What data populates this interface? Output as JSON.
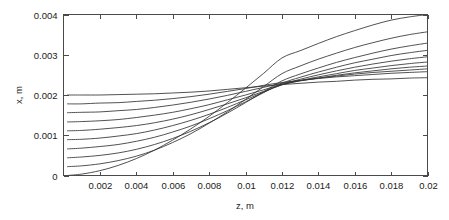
{
  "chart_data": {
    "type": "line",
    "title": "",
    "xlabel": "z, m",
    "ylabel": "x, m",
    "xlim": [
      0,
      0.02
    ],
    "ylim": [
      0,
      0.004
    ],
    "grid": false,
    "legend": null,
    "legend_position": "none",
    "xticks": [
      0.002,
      0.004,
      0.006,
      0.008,
      0.01,
      0.012,
      0.014,
      0.016,
      0.018,
      0.02
    ],
    "xtick_labels": [
      "0.002",
      "0.004",
      "0.006",
      "0.008",
      "0.01",
      "0.012",
      "0.014",
      "0.016",
      "0.018",
      "0.02"
    ],
    "yticks": [
      0,
      0.001,
      0.002,
      0.003,
      0.004
    ],
    "ytick_labels": [
      "0",
      "0.001",
      "0.002",
      "0.003",
      "0.004"
    ],
    "x": [
      0.0002,
      0.001,
      0.002,
      0.003,
      0.004,
      0.005,
      0.006,
      0.007,
      0.008,
      0.009,
      0.01,
      0.011,
      0.012,
      0.013,
      0.014,
      0.015,
      0.016,
      0.017,
      0.018,
      0.019,
      0.02
    ],
    "series": [
      {
        "name": "curve-1",
        "x0": 0.0002,
        "y0": 0.0,
        "values": [
          0.0,
          3.5e-05,
          0.00012,
          0.00025,
          0.00042,
          0.00063,
          0.00088,
          0.00116,
          0.00147,
          0.00181,
          0.00217,
          0.00254,
          0.00292,
          0.0031,
          0.00328,
          0.00345,
          0.0036,
          0.00374,
          0.00386,
          0.00394,
          0.004
        ]
      },
      {
        "name": "curve-2",
        "x0": 0.0002,
        "y0": 0.00022,
        "values": [
          0.00022,
          0.00024,
          0.00029,
          0.00037,
          0.00048,
          0.00063,
          0.00082,
          0.00104,
          0.0013,
          0.00158,
          0.00189,
          0.00221,
          0.00253,
          0.00272,
          0.00289,
          0.00304,
          0.00318,
          0.0033,
          0.00341,
          0.0035,
          0.00357
        ]
      },
      {
        "name": "curve-3",
        "x0": 0.0002,
        "y0": 0.00044,
        "values": [
          0.00044,
          0.00046,
          0.0005,
          0.00056,
          0.00065,
          0.00077,
          0.00092,
          0.0011,
          0.00131,
          0.00155,
          0.00181,
          0.00208,
          0.00235,
          0.00252,
          0.00267,
          0.00281,
          0.00293,
          0.00304,
          0.00314,
          0.00322,
          0.00329
        ]
      },
      {
        "name": "curve-4",
        "x0": 0.0002,
        "y0": 0.00066,
        "values": [
          0.00066,
          0.00068,
          0.00072,
          0.00077,
          0.00085,
          0.00095,
          0.00108,
          0.00123,
          0.00141,
          0.00161,
          0.00183,
          0.00206,
          0.00229,
          0.00244,
          0.00257,
          0.00269,
          0.0028,
          0.00289,
          0.00298,
          0.00305,
          0.00311
        ]
      },
      {
        "name": "curve-5",
        "x0": 0.0002,
        "y0": 0.00089,
        "values": [
          0.00089,
          0.0009,
          0.00093,
          0.00098,
          0.00104,
          0.00113,
          0.00124,
          0.00137,
          0.00152,
          0.00169,
          0.00188,
          0.00207,
          0.00226,
          0.00239,
          0.0025,
          0.0026,
          0.00269,
          0.00277,
          0.00284,
          0.0029,
          0.00295
        ]
      },
      {
        "name": "curve-6",
        "x0": 0.0002,
        "y0": 0.00111,
        "values": [
          0.00111,
          0.00112,
          0.00115,
          0.00119,
          0.00124,
          0.00131,
          0.0014,
          0.00151,
          0.00164,
          0.00178,
          0.00193,
          0.00209,
          0.00225,
          0.00236,
          0.00245,
          0.00253,
          0.00261,
          0.00267,
          0.00273,
          0.00278,
          0.00282
        ]
      },
      {
        "name": "curve-7",
        "x0": 0.0002,
        "y0": 0.00133,
        "values": [
          0.00133,
          0.00134,
          0.00136,
          0.00139,
          0.00144,
          0.0015,
          0.00157,
          0.00166,
          0.00176,
          0.00188,
          0.002,
          0.00213,
          0.00226,
          0.00235,
          0.00242,
          0.00249,
          0.00255,
          0.0026,
          0.00265,
          0.00269,
          0.00272
        ]
      },
      {
        "name": "curve-8",
        "x0": 0.0002,
        "y0": 0.00156,
        "values": [
          0.00156,
          0.00157,
          0.00158,
          0.00161,
          0.00164,
          0.00169,
          0.00175,
          0.00182,
          0.0019,
          0.00199,
          0.00209,
          0.00219,
          0.00229,
          0.00236,
          0.00242,
          0.00247,
          0.00252,
          0.00256,
          0.00259,
          0.00262,
          0.00265
        ]
      },
      {
        "name": "curve-9",
        "x0": 0.0002,
        "y0": 0.00178,
        "values": [
          0.00178,
          0.00178,
          0.0018,
          0.00181,
          0.00184,
          0.00187,
          0.00191,
          0.00196,
          0.00202,
          0.00209,
          0.00216,
          0.00224,
          0.00231,
          0.00236,
          0.00241,
          0.00245,
          0.00248,
          0.00251,
          0.00254,
          0.00256,
          0.00258
        ]
      },
      {
        "name": "curve-10",
        "x0": 0.0002,
        "y0": 0.002,
        "values": [
          0.002,
          0.002,
          0.002,
          0.00201,
          0.00202,
          0.00203,
          0.00205,
          0.00207,
          0.0021,
          0.00214,
          0.00218,
          0.00222,
          0.00226,
          0.00229,
          0.00232,
          0.00234,
          0.00237,
          0.00239,
          0.0024,
          0.00242,
          0.00243
        ]
      }
    ]
  },
  "style": {
    "curve_color": "#333333",
    "axis_color": "#4a4a4a",
    "text_color": "#1a1a1a",
    "background": "#ffffff"
  }
}
